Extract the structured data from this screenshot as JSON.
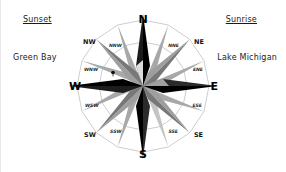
{
  "annotations": {
    "left": {
      "heading": "Sunset",
      "place": "Green Bay"
    },
    "right": {
      "heading": "Sunrise",
      "place": "Lake Michigan"
    }
  },
  "compass": {
    "cardinals": {
      "n": "N",
      "e": "E",
      "s": "S",
      "w": "W"
    },
    "ordinals": {
      "nw": "NW",
      "ne": "NE",
      "sw": "SW",
      "se": "SE"
    },
    "secondary": {
      "nnw": "NNW",
      "nne": "NNE",
      "wnw": "WNW",
      "ene": "ENE",
      "wsw": "WSW",
      "ese": "ESE",
      "ssw": "SSW",
      "sse": "SSE"
    },
    "colors": {
      "point_dark": "#000000",
      "point_light": "#b3b3b3",
      "point_mid": "#8c8c8c",
      "ring_line": "#9a9a9a",
      "text": "#1a1a1a"
    }
  }
}
